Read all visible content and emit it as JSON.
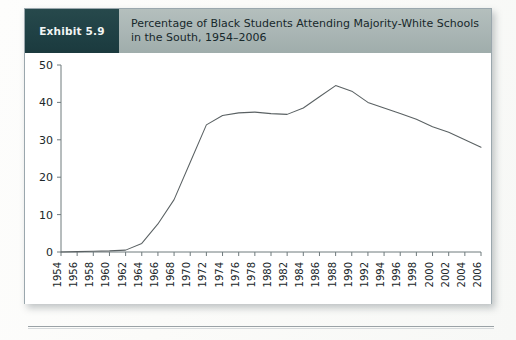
{
  "exhibit": {
    "badge_label": "Exhibit 5.9",
    "title": "Percentage of Black Students Attending Majority-White Schools in the South, 1954–2006",
    "title_line1": "Percentage of Black Students Attending Majority-White Schools",
    "title_line2": "in the South, 1954–2006"
  },
  "colors": {
    "badge_bg": "#1f4044",
    "header_bg": "#a9b5b4",
    "line": "#5a6163",
    "axis": "#6f7a7d",
    "card_border": "#9aa7ad",
    "card_bg": "#ffffff"
  },
  "chart_data": {
    "type": "line",
    "xlabel": "",
    "ylabel": "",
    "xlim": [
      1954,
      2006
    ],
    "ylim": [
      0,
      50
    ],
    "yticks": [
      0,
      10,
      20,
      30,
      40,
      50
    ],
    "ytick_labels": [
      "0",
      "10",
      "20",
      "30",
      "40",
      "50"
    ],
    "xticks": [
      1954,
      1956,
      1958,
      1960,
      1962,
      1964,
      1966,
      1968,
      1970,
      1972,
      1974,
      1976,
      1978,
      1980,
      1982,
      1984,
      1986,
      1988,
      1990,
      1992,
      1994,
      1996,
      1998,
      2000,
      2002,
      2004,
      2006
    ],
    "xtick_labels": [
      "1954",
      "1956",
      "1958",
      "1960",
      "1962",
      "1964",
      "1966",
      "1968",
      "1970",
      "1972",
      "1974",
      "1976",
      "1978",
      "1980",
      "1982",
      "1984",
      "1986",
      "1988",
      "1990",
      "1992",
      "1994",
      "1996",
      "1998",
      "2000",
      "2002",
      "2004",
      "2006"
    ],
    "xtick_rotation": 90,
    "grid": false,
    "legend": false,
    "markers": false,
    "series": [
      {
        "name": "Percentage of Black students in majority-white schools (South)",
        "color": "#5a6163",
        "x": [
          1954,
          1956,
          1958,
          1960,
          1962,
          1964,
          1966,
          1968,
          1970,
          1972,
          1974,
          1976,
          1978,
          1980,
          1982,
          1984,
          1986,
          1988,
          1990,
          1992,
          1994,
          1996,
          1998,
          2000,
          2002,
          2004,
          2006
        ],
        "values": [
          0.0,
          0.1,
          0.2,
          0.3,
          0.5,
          2.3,
          7.5,
          14.0,
          24.0,
          34.0,
          36.5,
          37.2,
          37.4,
          37.0,
          36.8,
          38.5,
          41.5,
          44.5,
          43.0,
          40.0,
          38.5,
          37.0,
          35.5,
          33.5,
          32.0,
          30.0,
          28.0
        ]
      }
    ],
    "peak": {
      "year": 1988,
      "value": 44.5
    },
    "end": {
      "year": 2006,
      "value": 28.0
    }
  }
}
